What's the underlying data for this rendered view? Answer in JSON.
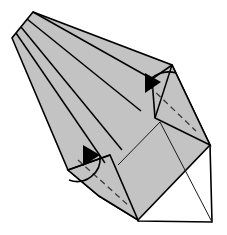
{
  "figure": {
    "kind": "origami-step",
    "canvas": {
      "width": 227,
      "height": 235
    },
    "background_color": "#ffffff"
  },
  "palette": {
    "paper_front_gray": "#c3c3c3",
    "paper_back_white": "#ffffff",
    "line_black": "#000000",
    "crease_dash_gray": "#3a3a3a"
  },
  "surfaces": [
    {
      "name": "main-body-left",
      "side": "front",
      "fill": "#c3c3c3",
      "points": "33,12 12,38 68,170 99,196 138,220 210,145 172,65"
    },
    {
      "name": "top-right-flap",
      "side": "front",
      "fill": "#c3c3c3",
      "points": "152,79 172,65 210,145 155,118"
    },
    {
      "name": "bottom-left-flap",
      "side": "front",
      "fill": "#c3c3c3",
      "points": "68,170 110,155 138,220 99,196"
    },
    {
      "name": "back-panel-white",
      "side": "back",
      "fill": "#ffffff",
      "points": "118,165 160,122 210,145 212,222 138,221"
    }
  ],
  "creases": [
    {
      "name": "radial-crease-1",
      "type": "mountain",
      "path": "M 33,12 L 152,79"
    },
    {
      "name": "radial-crease-2",
      "type": "mountain",
      "path": "M 27,19 L 141,111"
    },
    {
      "name": "radial-crease-3",
      "type": "mountain",
      "path": "M 21,27 L 122,150"
    },
    {
      "name": "radial-crease-4",
      "type": "mountain",
      "path": "M 16,33 L 105,163"
    },
    {
      "name": "flap-edge-right",
      "type": "mountain",
      "path": "M 172,65 L 155,118"
    },
    {
      "name": "flap-edge-lower-left",
      "type": "mountain",
      "path": "M 68,170 L 110,155"
    },
    {
      "name": "back-panel-diagonal",
      "type": "thin",
      "path": "M 160,122 L 212,222"
    },
    {
      "name": "back-panel-left-fold",
      "type": "thin",
      "path": "M 118,165 L 160,122"
    }
  ],
  "valley_folds": [
    {
      "name": "valley-fold-top-right",
      "path": "M 149,86 L 196,131"
    },
    {
      "name": "valley-fold-bottom-left",
      "path": "M 78,160 L 128,205"
    }
  ],
  "arrows": [
    {
      "name": "fold-arrow-top-right",
      "direction": "down-left",
      "curve": "M 176,73 A 26 26 0 0 0 146,85",
      "head": "145,73 161,82 145,93"
    },
    {
      "name": "fold-arrow-bottom-left",
      "direction": "up-right",
      "curve": "M 69,180 A 23 23 0 0 0 100,156",
      "head": "83,145 100,155 83,166"
    }
  ],
  "labels": {
    "step_caption": "",
    "notes": ""
  }
}
